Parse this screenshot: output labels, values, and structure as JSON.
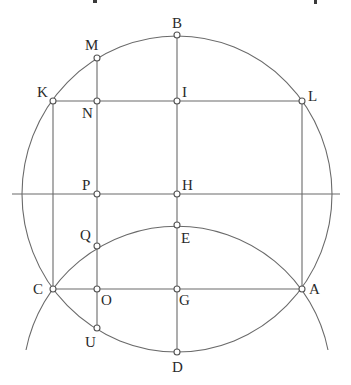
{
  "figure": {
    "type": "geometric-construction",
    "main_circle": {
      "center": "H",
      "cx": 177,
      "cy": 194,
      "rx": 155,
      "ry": 158
    },
    "secondary_arc": {
      "cx": 177,
      "cy": 379,
      "r": 154,
      "from": [
        26,
        350
      ],
      "to": [
        328,
        350
      ],
      "passes_through": [
        "C",
        "E",
        "A"
      ]
    },
    "horizontal_axis": {
      "y": 194,
      "x1": 12,
      "x2": 340
    },
    "points": [
      {
        "label": "B",
        "x": 177,
        "y": 35,
        "lx": 172,
        "ly": 28
      },
      {
        "label": "M",
        "x": 97,
        "y": 58,
        "lx": 85,
        "ly": 50
      },
      {
        "label": "K",
        "x": 53,
        "y": 101,
        "lx": 37,
        "ly": 97
      },
      {
        "label": "N",
        "x": 97,
        "y": 101,
        "lx": 82,
        "ly": 118
      },
      {
        "label": "I",
        "x": 177,
        "y": 101,
        "lx": 182,
        "ly": 97
      },
      {
        "label": "L",
        "x": 302,
        "y": 101,
        "lx": 308,
        "ly": 101
      },
      {
        "label": "P",
        "x": 97,
        "y": 194,
        "lx": 82,
        "ly": 190
      },
      {
        "label": "H",
        "x": 177,
        "y": 194,
        "lx": 182,
        "ly": 190
      },
      {
        "label": "Q",
        "x": 97,
        "y": 246,
        "lx": 80,
        "ly": 240
      },
      {
        "label": "E",
        "x": 177,
        "y": 225,
        "lx": 181,
        "ly": 243
      },
      {
        "label": "C",
        "x": 53,
        "y": 289,
        "lx": 33,
        "ly": 294
      },
      {
        "label": "O",
        "x": 97,
        "y": 289,
        "lx": 101,
        "ly": 305
      },
      {
        "label": "G",
        "x": 177,
        "y": 289,
        "lx": 179,
        "ly": 305
      },
      {
        "label": "A",
        "x": 302,
        "y": 289,
        "lx": 309,
        "ly": 294
      },
      {
        "label": "U",
        "x": 97,
        "y": 328,
        "lx": 85,
        "ly": 347
      },
      {
        "label": "D",
        "x": 177,
        "y": 352,
        "lx": 172,
        "ly": 372
      }
    ],
    "segments": [
      [
        "K",
        "C"
      ],
      [
        "L",
        "A"
      ],
      [
        "M",
        "U"
      ],
      [
        "B",
        "D"
      ],
      [
        "K",
        "L"
      ],
      [
        "C",
        "A"
      ]
    ]
  }
}
